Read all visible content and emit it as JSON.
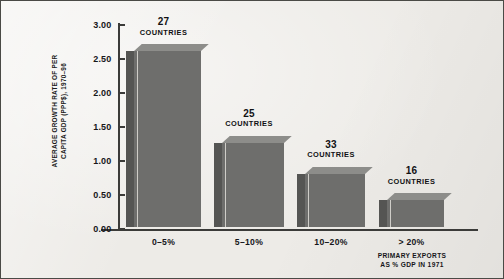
{
  "chart_data": {
    "type": "bar",
    "title": "",
    "subtitle": "",
    "xlabel": "PRIMARY EXPORTS\nAS % GDP IN 1971",
    "ylabel": "AVERAGE GROWTH RATE OF PER\nCAPITA GDP (PPP$), 1970–96",
    "categories": [
      "0–5%",
      "5–10%",
      "10–20%",
      "> 20%"
    ],
    "values": [
      2.67,
      1.33,
      0.87,
      0.48
    ],
    "point_labels": [
      "27",
      "25",
      "33",
      "16"
    ],
    "point_label_suffix": "COUNTRIES",
    "ylim": [
      0.0,
      3.0
    ],
    "ytick_values": [
      "3.00",
      "2.50",
      "2.00",
      "1.50",
      "1.00",
      "0.50",
      "0.00"
    ],
    "grid": false,
    "legend": "none",
    "colors": {
      "background": "#edebe7",
      "bar_face": "#6e6e6c",
      "bar_side": "#555553",
      "bar_top": "#8d8d8a",
      "bar_highlight": "#cfcdc8",
      "axis": "#3b3b39",
      "text": "#16161a",
      "border": "#4a4a46"
    }
  },
  "figure": {
    "y_axis_title": "AVERAGE GROWTH RATE OF PER\nCAPITA GDP (PPP$), 1970–96",
    "x_axis_title": "PRIMARY EXPORTS\nAS % GDP IN 1971",
    "ticks": [
      {
        "label": "3.00"
      },
      {
        "label": "2.50"
      },
      {
        "label": "2.00"
      },
      {
        "label": "1.50"
      },
      {
        "label": "1.00"
      },
      {
        "label": "0.50"
      },
      {
        "label": "0.00"
      }
    ],
    "bars": [
      {
        "count": "27",
        "unit": "COUNTRIES",
        "category": "0–5%",
        "value": 2.67
      },
      {
        "count": "25",
        "unit": "COUNTRIES",
        "category": "5–10%",
        "value": 1.33
      },
      {
        "count": "33",
        "unit": "COUNTRIES",
        "category": "10–20%",
        "value": 0.87
      },
      {
        "count": "16",
        "unit": "COUNTRIES",
        "category": "> 20%",
        "value": 0.48
      }
    ]
  }
}
